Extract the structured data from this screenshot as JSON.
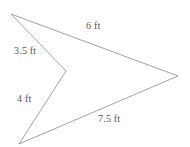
{
  "figure": {
    "name": "concave-arrow-polygon",
    "background_color": "#ffffff",
    "stroke_color": "#8a8a8e",
    "stroke_width": 0.8,
    "label_color": "#55565a",
    "width": 190,
    "height": 147,
    "vertices": [
      {
        "name": "top-left-point",
        "x": 11,
        "y": 14
      },
      {
        "name": "right-point",
        "x": 178,
        "y": 76
      },
      {
        "name": "bottom-left-point",
        "x": 19,
        "y": 144
      },
      {
        "name": "concave-notch-point",
        "x": 66,
        "y": 71
      }
    ],
    "labels": [
      {
        "id": "top",
        "text": "6 ft"
      },
      {
        "id": "left_upper",
        "text": "3.5 ft"
      },
      {
        "id": "left_lower",
        "text": "4 ft"
      },
      {
        "id": "bottom",
        "text": "7.5 ft"
      }
    ],
    "label_top": "6 ft",
    "label_left_upper": "3.5 ft",
    "label_left_lower": "4 ft",
    "label_bottom": "7.5 ft"
  },
  "chart_data": {
    "type": "diagram",
    "title": "",
    "shape": "concave quadrilateral (arrowhead / dart)",
    "units": "ft",
    "vertices": [
      {
        "label": "A",
        "x": 11,
        "y": 14
      },
      {
        "label": "B",
        "x": 178,
        "y": 76
      },
      {
        "label": "C",
        "x": 19,
        "y": 144
      },
      {
        "label": "D",
        "x": 66,
        "y": 71
      }
    ],
    "edges": [
      {
        "from": "A",
        "to": "B",
        "length": 6,
        "label": "6 ft"
      },
      {
        "from": "B",
        "to": "C",
        "length": 7.5,
        "label": "7.5 ft"
      },
      {
        "from": "C",
        "to": "D",
        "length": 4,
        "label": "4 ft"
      },
      {
        "from": "D",
        "to": "A",
        "length": 3.5,
        "label": "3.5 ft"
      }
    ],
    "side_lengths": [
      6,
      7.5,
      4,
      3.5
    ],
    "side_labels": [
      "6 ft",
      "7.5 ft",
      "4 ft",
      "3.5 ft"
    ]
  }
}
